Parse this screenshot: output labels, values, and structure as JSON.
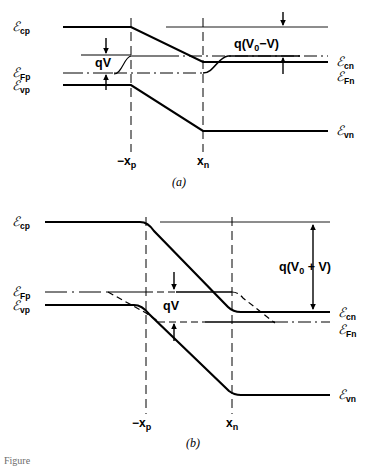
{
  "figure": {
    "type": "energy-band-diagram",
    "partial_caption": "Figure",
    "panels": [
      {
        "id": "a",
        "caption": "(a)",
        "bias": "forward",
        "left_labels": [
          {
            "name": "Ecp",
            "symbol": "E",
            "sub": "cp"
          },
          {
            "name": "EFp",
            "symbol": "E",
            "sub": "Fp"
          },
          {
            "name": "Evp",
            "symbol": "E",
            "sub": "vp"
          }
        ],
        "right_labels": [
          {
            "name": "Ecn",
            "symbol": "E",
            "sub": "cn"
          },
          {
            "name": "EFn",
            "symbol": "E",
            "sub": "Fn"
          },
          {
            "name": "Evn",
            "symbol": "E",
            "sub": "vn"
          }
        ],
        "annotations": [
          {
            "name": "qV",
            "text": "qV"
          },
          {
            "name": "barrier",
            "text": "q(V0−V)",
            "base": "q(V",
            "sub": "0",
            "tail": "−V)"
          }
        ],
        "axis_labels": [
          {
            "name": "minus-xp",
            "base": "−x",
            "sub": "p"
          },
          {
            "name": "xn",
            "base": "x",
            "sub": "n"
          }
        ]
      },
      {
        "id": "b",
        "caption": "(b)",
        "bias": "reverse",
        "left_labels": [
          {
            "name": "Ecp",
            "symbol": "E",
            "sub": "cp"
          },
          {
            "name": "EFp",
            "symbol": "E",
            "sub": "Fp"
          },
          {
            "name": "Evp",
            "symbol": "E",
            "sub": "vp"
          }
        ],
        "right_labels": [
          {
            "name": "Ecn",
            "symbol": "E",
            "sub": "cn"
          },
          {
            "name": "EFn",
            "symbol": "E",
            "sub": "Fn"
          },
          {
            "name": "Evn",
            "symbol": "E",
            "sub": "vn"
          }
        ],
        "annotations": [
          {
            "name": "qV",
            "text": "qV"
          },
          {
            "name": "barrier",
            "text": "q(V0 + V)",
            "base": "q(V",
            "sub": "0",
            "tail": " + V)"
          }
        ],
        "axis_labels": [
          {
            "name": "minus-xp",
            "base": "−x",
            "sub": "p"
          },
          {
            "name": "xn",
            "base": "x",
            "sub": "n"
          }
        ]
      }
    ],
    "colors": {
      "band_line": "#000000",
      "thin_line": "#111111",
      "background": "#ffffff"
    }
  },
  "labels": {
    "E": "ℰ",
    "cp": "cp",
    "Fp": "Fp",
    "vp": "vp",
    "cn": "cn",
    "Fn": "Fn",
    "vn": "vn",
    "qV": "qV",
    "q_open": "q(V",
    "zero": "0",
    "a_tail": "−V)",
    "b_tail": " + V)",
    "minus_x": "−x",
    "p": "p",
    "x": "x",
    "n": "n",
    "cap_a": "(a)",
    "cap_b": "(b)",
    "figcap": "Figure"
  }
}
